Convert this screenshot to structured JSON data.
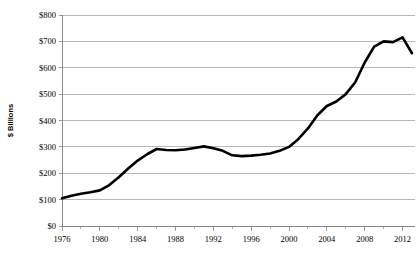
{
  "chart_data": {
    "type": "line",
    "title": "",
    "xlabel": "",
    "ylabel": "$ Billions",
    "xlim": [
      1976,
      2013
    ],
    "ylim": [
      0,
      800
    ],
    "grid": true,
    "legend": "none",
    "y_tick_labels": [
      "$800",
      "$700",
      "$600",
      "$500",
      "$400",
      "$300",
      "$200",
      "$100",
      "$0"
    ],
    "y_tick_values": [
      800,
      700,
      600,
      500,
      400,
      300,
      200,
      100,
      0
    ],
    "x_tick_labels": [
      "1976",
      "1980",
      "1984",
      "1988",
      "1992",
      "1996",
      "2000",
      "2004",
      "2008",
      "2012"
    ],
    "x_tick_values": [
      1976,
      1980,
      1984,
      1988,
      1992,
      1996,
      2000,
      2004,
      2008,
      2012
    ],
    "x_minor_tick_values": [
      1978,
      1982,
      1986,
      1990,
      1994,
      1998,
      2002,
      2006,
      2010
    ],
    "series": [
      {
        "name": "",
        "color": "#000000",
        "x": [
          1976,
          1977,
          1978,
          1979,
          1980,
          1981,
          1982,
          1983,
          1984,
          1985,
          1986,
          1987,
          1988,
          1989,
          1990,
          1991,
          1992,
          1993,
          1994,
          1995,
          1996,
          1997,
          1998,
          1999,
          2000,
          2001,
          2002,
          2003,
          2004,
          2005,
          2006,
          2007,
          2008,
          2009,
          2010,
          2011,
          2012,
          2013
        ],
        "values": [
          105,
          115,
          122,
          128,
          135,
          155,
          185,
          218,
          248,
          272,
          292,
          288,
          287,
          290,
          296,
          302,
          295,
          285,
          268,
          265,
          267,
          270,
          275,
          285,
          300,
          330,
          370,
          420,
          455,
          472,
          500,
          545,
          620,
          680,
          700,
          697,
          715,
          655
        ]
      }
    ]
  },
  "layout": {
    "plot_left": 62,
    "plot_right": 412,
    "plot_top": 15,
    "plot_bottom": 226,
    "gridline_right": 415
  }
}
